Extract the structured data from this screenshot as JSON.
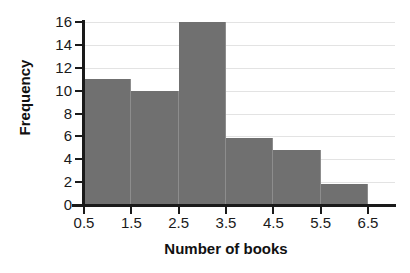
{
  "chart_data": {
    "type": "bar",
    "title": "",
    "xlabel": "Number of books",
    "ylabel": "Frequency",
    "bin_edges": [
      0.5,
      1.5,
      2.5,
      3.5,
      4.5,
      5.5,
      6.5
    ],
    "categories": [
      "0.5-1.5",
      "1.5-2.5",
      "2.5-3.5",
      "3.5-4.5",
      "4.5-5.5",
      "5.5-6.5"
    ],
    "values": [
      11,
      10,
      16,
      5.9,
      4.8,
      1.8
    ],
    "xtick_labels": [
      "0.5",
      "1.5",
      "2.5",
      "3.5",
      "4.5",
      "5.5",
      "6.5"
    ],
    "ytick_labels": [
      "0",
      "2",
      "4",
      "6",
      "8",
      "10",
      "12",
      "14",
      "16"
    ],
    "ytick_values": [
      0,
      2,
      4,
      6,
      8,
      10,
      12,
      14,
      16
    ],
    "ylim": [
      0,
      16
    ],
    "xlim": [
      0.5,
      6.5
    ],
    "grid": "horizontal",
    "legend": "none",
    "bar_color": "#707070",
    "grid_color": "#e3e3e3",
    "axis_color": "#1a1a1a",
    "background_color": "#ffffff"
  }
}
